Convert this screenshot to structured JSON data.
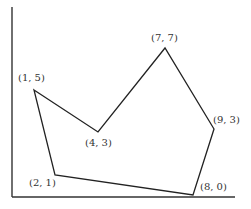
{
  "diagram": {
    "title": "",
    "axes": {
      "x_axis": {
        "x1": 12,
        "y1": 197,
        "x2": 235,
        "y2": 197
      },
      "y_axis": {
        "x1": 12,
        "y1": 7,
        "x2": 12,
        "y2": 197
      }
    },
    "polygon_order": [
      "(1, 5)",
      "(4, 3)",
      "(7, 7)",
      "(9, 3)",
      "(8, 0)",
      "(2, 1)"
    ],
    "vertices": [
      {
        "label": "(1, 5)",
        "px": 34,
        "py": 90,
        "lx": 18,
        "ly": 81
      },
      {
        "label": "(4, 3)",
        "px": 98,
        "py": 132,
        "lx": 85,
        "ly": 146
      },
      {
        "label": "(7, 7)",
        "px": 165,
        "py": 48,
        "lx": 151,
        "ly": 41
      },
      {
        "label": "(9, 3)",
        "px": 214,
        "py": 129,
        "lx": 213,
        "ly": 123
      },
      {
        "label": "(8, 0)",
        "px": 193,
        "py": 195,
        "lx": 200,
        "ly": 190
      },
      {
        "label": "(2, 1)",
        "px": 55,
        "py": 175,
        "lx": 29,
        "ly": 186
      }
    ],
    "stroke_color": "#222222",
    "axis_color": "#333333"
  }
}
